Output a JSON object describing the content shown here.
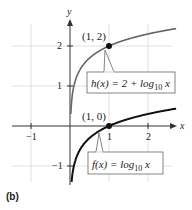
{
  "chart_data": {
    "type": "line",
    "title": "",
    "panel_label": "(b)",
    "xlabel": "x",
    "ylabel": "y",
    "xlim": [
      -1.5,
      2.7
    ],
    "ylim": [
      -1.6,
      2.8
    ],
    "grid": true,
    "x_ticks": [
      -1,
      1,
      2
    ],
    "y_ticks": [
      -1,
      1,
      2
    ],
    "x_tick_labels": [
      "−1",
      "1",
      "2"
    ],
    "y_tick_labels": [
      "−1",
      "1",
      "2"
    ],
    "series": [
      {
        "name": "h(x) = 2 + log10 x",
        "color": "#555555",
        "function": "2 + log10(x)",
        "x": [
          0.03,
          0.05,
          0.1,
          0.2,
          0.3,
          0.5,
          0.75,
          1,
          1.5,
          2,
          2.5
        ],
        "y": [
          0.48,
          0.7,
          1.0,
          1.3,
          1.48,
          1.7,
          1.88,
          2.0,
          2.18,
          2.3,
          2.4
        ]
      },
      {
        "name": "f(x) = log10 x",
        "color": "#111111",
        "function": "log10(x)",
        "x": [
          0.03,
          0.05,
          0.1,
          0.2,
          0.3,
          0.5,
          0.75,
          1,
          1.5,
          2,
          2.5
        ],
        "y": [
          -1.52,
          -1.3,
          -1.0,
          -0.7,
          -0.52,
          -0.3,
          -0.12,
          0.0,
          0.18,
          0.3,
          0.4
        ]
      }
    ],
    "annotations": [
      {
        "point": [
          1,
          2
        ],
        "label": "(1, 2)"
      },
      {
        "point": [
          1,
          0
        ],
        "label": "(1, 0)"
      },
      {
        "callout": "h(x) = 2 + log10 x",
        "parts": {
          "lhs": "h(x) = 2 + log",
          "sub": "10",
          "var": " x"
        }
      },
      {
        "callout": "f(x) = log10 x",
        "parts": {
          "lhs": "f(x) = log",
          "sub": "10",
          "var": " x"
        }
      }
    ]
  },
  "labels": {
    "x_axis": "x",
    "y_axis": "y",
    "tick_x_neg1": "−1",
    "tick_x_1": "1",
    "tick_x_2": "2",
    "tick_y_neg1": "−1",
    "tick_y_1": "1",
    "tick_y_2": "2",
    "point_h": "(1, 2)",
    "point_f": "(1, 0)",
    "h_lhs": "h(x) = 2 + log",
    "h_sub": "10",
    "h_var": " x",
    "f_lhs": "f(x) = log",
    "f_sub": "10",
    "f_var": " x",
    "panel": "(b)"
  }
}
